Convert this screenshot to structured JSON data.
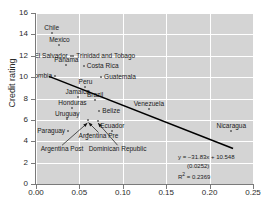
{
  "chart_data": {
    "type": "scatter",
    "title": "",
    "xlabel": "",
    "ylabel": "Credit rating",
    "xlim": [
      0.0,
      0.25
    ],
    "ylim": [
      0,
      16
    ],
    "xticks": [
      "0.00",
      "0.05",
      "0.10",
      "0.15",
      "0.20",
      "0.25"
    ],
    "xtick_values": [
      0.0,
      0.05,
      0.1,
      0.15,
      0.2,
      0.25
    ],
    "yticks": [
      "0",
      "2",
      "4",
      "6",
      "8",
      "10",
      "12",
      "14",
      "16"
    ],
    "ytick_values": [
      0,
      2,
      4,
      6,
      8,
      10,
      12,
      14,
      16
    ],
    "grid": true,
    "legend": "none",
    "points": [
      {
        "label": "Chile",
        "x": 0.018,
        "y": 14.1,
        "pos": "above"
      },
      {
        "label": "Mexico",
        "x": 0.027,
        "y": 13.0,
        "pos": "above"
      },
      {
        "label": "El Salvador",
        "x": 0.04,
        "y": 12.0,
        "pos": "left"
      },
      {
        "label": "Trinidad and Tobago",
        "x": 0.043,
        "y": 12.0,
        "pos": "right"
      },
      {
        "label": "Panama",
        "x": 0.035,
        "y": 11.1,
        "pos": "above"
      },
      {
        "label": "Costa Rica",
        "x": 0.055,
        "y": 11.0,
        "pos": "right"
      },
      {
        "label": "Colombia",
        "x": 0.022,
        "y": 10.1,
        "pos": "left"
      },
      {
        "label": "Guatemala",
        "x": 0.075,
        "y": 10.0,
        "pos": "right"
      },
      {
        "label": "Peru",
        "x": 0.057,
        "y": 9.1,
        "pos": "above"
      },
      {
        "label": "Jamaica",
        "x": 0.048,
        "y": 8.1,
        "pos": "above"
      },
      {
        "label": "Honduras",
        "x": 0.042,
        "y": 7.1,
        "pos": "above"
      },
      {
        "label": "Brazil",
        "x": 0.068,
        "y": 7.9,
        "pos": "above"
      },
      {
        "label": "Venezuela",
        "x": 0.13,
        "y": 7.0,
        "pos": "above"
      },
      {
        "label": "Belize",
        "x": 0.073,
        "y": 6.8,
        "pos": "right"
      },
      {
        "label": "Uruguay",
        "x": 0.036,
        "y": 6.1,
        "pos": "above"
      },
      {
        "label": "Paraguay",
        "x": 0.037,
        "y": 5.0,
        "pos": "left"
      },
      {
        "label": "Ecuador",
        "x": 0.088,
        "y": 5.0,
        "pos": "above"
      },
      {
        "label": "Nicaragua",
        "x": 0.225,
        "y": 5.0,
        "pos": "above"
      },
      {
        "label": "Argentina Pre",
        "x": 0.06,
        "y": 6.0,
        "pos": "callout"
      },
      {
        "label": "Argentina Post",
        "x": 0.06,
        "y": 4.7,
        "pos": "callout"
      },
      {
        "label": "Dominican Republic",
        "x": 0.071,
        "y": 5.9,
        "pos": "callout"
      }
    ],
    "trendline": {
      "slope": -31.83,
      "intercept": 10.548,
      "x_start": 0.015,
      "x_end": 0.227,
      "equation": "y = −31.83x + 10.548",
      "std_error": "(0.0252)",
      "r_squared_prefix": "R",
      "r_squared_sup": "2",
      "r_squared_value": " = 0.2369"
    },
    "callouts": [
      {
        "label": "Argentina Pre",
        "text_x": 0.072,
        "text_y": 4.45,
        "point_x": 0.0605,
        "point_y": 5.75
      },
      {
        "label": "Argentina Post",
        "text_x": 0.03,
        "text_y": 3.25,
        "point_x": 0.0592,
        "point_y": 5.7
      },
      {
        "label": "Dominican Republic",
        "text_x": 0.094,
        "text_y": 3.25,
        "point_x": 0.0715,
        "point_y": 5.7
      }
    ]
  },
  "colors": {
    "plot_background": "#d4d4d4",
    "gridline": "#ffffff",
    "trendline": "#000000",
    "marker": "#5f5f5f",
    "text": "#1a1a1a",
    "axis": "#7a7a7a"
  }
}
